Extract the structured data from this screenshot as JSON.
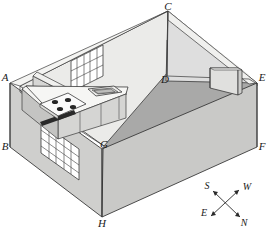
{
  "diagram": {
    "type": "isometric-room-drawing"
  },
  "vertices": [
    {
      "id": "A",
      "label": "A",
      "x": 10,
      "y": 83,
      "role": "top-left-wall-corner"
    },
    {
      "id": "B",
      "label": "B",
      "x": 10,
      "y": 147,
      "role": "bottom-left-wall-corner"
    },
    {
      "id": "C",
      "label": "C",
      "x": 168,
      "y": 11,
      "role": "top-back-wall-corner"
    },
    {
      "id": "D",
      "label": "D",
      "x": 166,
      "y": 81,
      "role": "inner-back-floor-corner"
    },
    {
      "id": "E",
      "label": "E",
      "x": 257,
      "y": 83,
      "role": "top-right-wall-corner"
    },
    {
      "id": "F",
      "label": "F",
      "x": 257,
      "y": 147,
      "role": "bottom-right-wall-corner"
    },
    {
      "id": "G",
      "label": "G",
      "x": 104,
      "y": 146,
      "role": "inner-front-floor-corner"
    },
    {
      "id": "H",
      "label": "H",
      "x": 102,
      "y": 217,
      "role": "bottom-front-wall-corner"
    }
  ],
  "compass": {
    "name": "compass-rose",
    "directions": [
      {
        "id": "S",
        "label": "S",
        "position": "upper-left"
      },
      {
        "id": "W",
        "label": "W",
        "position": "upper-right"
      },
      {
        "id": "E",
        "label": "E",
        "position": "lower-left"
      },
      {
        "id": "N",
        "label": "N",
        "position": "lower-right"
      }
    ]
  },
  "fixtures": [
    {
      "id": "stove",
      "label": "stove",
      "burners": 4
    },
    {
      "id": "sink",
      "label": "sink",
      "basins": 1
    },
    {
      "id": "upper-cabinets",
      "label": "upper cabinets",
      "count": 2
    },
    {
      "id": "base-cabinets",
      "label": "base cabinets",
      "count": 4
    },
    {
      "id": "countertop",
      "label": "countertop",
      "count": 1
    },
    {
      "id": "window-upper",
      "label": "window",
      "grid": "5x3"
    },
    {
      "id": "window-lower",
      "label": "window",
      "grid": "5x4"
    },
    {
      "id": "partition-wall",
      "label": "partition wall",
      "count": 1
    }
  ],
  "colors": {
    "outline": "#3a3a3a",
    "wall_light": "#e8e8e6",
    "wall_mid": "#d4d4d2",
    "wall_shadow": "#c2c2c0",
    "floor": "#a9a9a8",
    "counter_top": "#f2f2f0",
    "counter_face": "#d8d8d6",
    "cabinet": "#cccccb",
    "stove_top": "#f6f6f4",
    "burner": "#2a2a2a",
    "window_frame": "#ffffff",
    "background": "#ffffff",
    "label_text": "#1a1a1a"
  }
}
